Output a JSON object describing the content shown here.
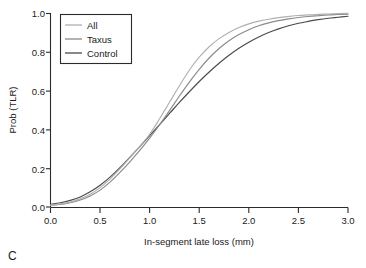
{
  "panel": {
    "label": "C"
  },
  "chart_data": {
    "type": "line",
    "title": "",
    "subtitle": "",
    "xlabel": "In-segment late loss (mm)",
    "ylabel": "Prob (TLR)",
    "xlim": [
      0.0,
      3.0
    ],
    "ylim": [
      0.0,
      1.0
    ],
    "xticks": [
      0.0,
      0.5,
      1.0,
      1.5,
      2.0,
      2.5,
      3.0
    ],
    "xticklabels": [
      "0.0",
      "0.5",
      "1.0",
      "1.5",
      "2.0",
      "2.5",
      "3.0"
    ],
    "yticks": [
      0.0,
      0.2,
      0.4,
      0.6,
      0.8,
      1.0
    ],
    "yticklabels": [
      "0.0",
      "0.2",
      "0.4",
      "0.6",
      "0.8",
      "1.0"
    ],
    "grid": false,
    "legend_position": "top-left",
    "x": [
      0.0,
      0.1,
      0.2,
      0.3,
      0.4,
      0.5,
      0.6,
      0.7,
      0.8,
      0.9,
      1.0,
      1.1,
      1.2,
      1.3,
      1.4,
      1.5,
      1.6,
      1.7,
      1.8,
      1.9,
      2.0,
      2.1,
      2.2,
      2.3,
      2.4,
      2.5,
      2.6,
      2.7,
      2.8,
      2.9,
      3.0
    ],
    "series": [
      {
        "name": "All",
        "color": "#b0b0b0",
        "values": [
          0.01,
          0.016,
          0.026,
          0.042,
          0.066,
          0.1,
          0.144,
          0.196,
          0.253,
          0.312,
          0.375,
          0.455,
          0.54,
          0.625,
          0.705,
          0.772,
          0.826,
          0.868,
          0.9,
          0.925,
          0.944,
          0.958,
          0.968,
          0.976,
          0.982,
          0.987,
          0.99,
          0.993,
          0.995,
          0.997,
          0.998
        ]
      },
      {
        "name": "Taxus",
        "color": "#8a8a8a",
        "values": [
          0.008,
          0.013,
          0.022,
          0.036,
          0.057,
          0.087,
          0.128,
          0.178,
          0.233,
          0.292,
          0.355,
          0.424,
          0.497,
          0.572,
          0.644,
          0.71,
          0.768,
          0.817,
          0.857,
          0.889,
          0.914,
          0.934,
          0.949,
          0.961,
          0.97,
          0.977,
          0.982,
          0.986,
          0.99,
          0.992,
          0.994
        ]
      },
      {
        "name": "Control",
        "color": "#4a4a4a",
        "values": [
          0.014,
          0.022,
          0.034,
          0.052,
          0.078,
          0.112,
          0.154,
          0.203,
          0.256,
          0.311,
          0.368,
          0.425,
          0.482,
          0.539,
          0.594,
          0.647,
          0.696,
          0.741,
          0.782,
          0.818,
          0.849,
          0.876,
          0.899,
          0.918,
          0.934,
          0.947,
          0.957,
          0.966,
          0.973,
          0.978,
          0.983
        ]
      }
    ]
  },
  "legend": {
    "entries": [
      {
        "label": "All"
      },
      {
        "label": "Taxus"
      },
      {
        "label": "Control"
      }
    ]
  },
  "colors": {
    "axis": "#2b2b2b",
    "text": "#1a1a1a",
    "background": "#ffffff"
  }
}
